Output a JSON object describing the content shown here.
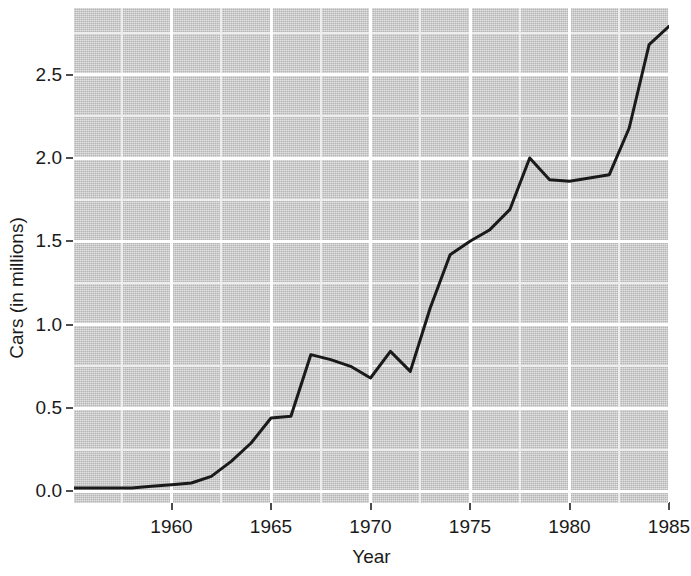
{
  "chart_data": {
    "type": "line",
    "title": "",
    "subtitle": "",
    "xlabel": "Year",
    "ylabel": "Cars (in millions)",
    "xlim": [
      1955.1,
      1985.0
    ],
    "ylim": [
      -0.07,
      2.9
    ],
    "grid": true,
    "legend": false,
    "legend_position": "none",
    "x_ticks": [
      1960,
      1965,
      1970,
      1975,
      1980,
      1985
    ],
    "x_tick_labels": [
      "1960",
      "1965",
      "1970",
      "1975",
      "1980",
      "1985"
    ],
    "y_ticks": [
      0.0,
      0.5,
      1.0,
      1.5,
      2.0,
      2.5
    ],
    "y_tick_labels": [
      "0.0",
      "0.5",
      "1.0",
      "1.5",
      "2.0",
      "2.5"
    ],
    "x_minor_ticks": [
      1957.5,
      1962.5,
      1967.5,
      1972.5,
      1977.5,
      1982.5
    ],
    "y_minor_ticks": [
      0.25,
      0.75,
      1.25,
      1.75,
      2.25,
      2.75
    ],
    "line_color": "#1a1a1a",
    "line_width": 3,
    "panel_background": "#c9c9c9",
    "gridline_color": "#ffffff",
    "series": [
      {
        "name": "Cars",
        "x": [
          1955,
          1956,
          1957,
          1958,
          1959,
          1960,
          1961,
          1962,
          1963,
          1964,
          1965,
          1966,
          1967,
          1968,
          1969,
          1970,
          1971,
          1972,
          1973,
          1974,
          1975,
          1976,
          1977,
          1978,
          1979,
          1980,
          1981,
          1982,
          1983,
          1984,
          1985
        ],
        "y": [
          0.02,
          0.02,
          0.02,
          0.02,
          0.03,
          0.04,
          0.05,
          0.09,
          0.18,
          0.29,
          0.44,
          0.45,
          0.82,
          0.79,
          0.75,
          0.68,
          0.84,
          0.72,
          1.1,
          1.42,
          1.5,
          1.57,
          1.69,
          2.0,
          1.87,
          1.86,
          1.88,
          1.9,
          2.18,
          2.68,
          2.79
        ]
      }
    ]
  }
}
